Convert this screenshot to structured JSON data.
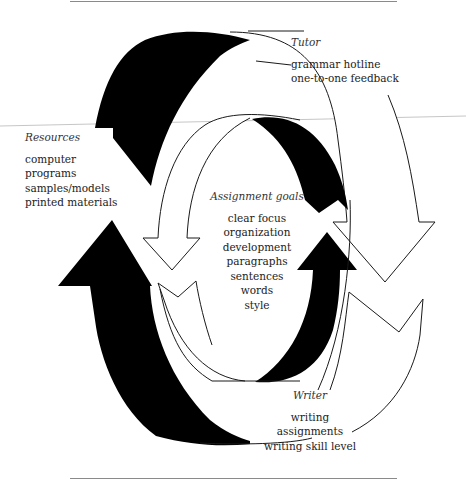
{
  "diagram": {
    "type": "cycle-of-arrows",
    "colors": {
      "solid_arrow": "#000000",
      "outline_arrow_stroke": "#1a1a1a",
      "outline_arrow_fill": "#ffffff",
      "rule": "#8a8a8a",
      "text": "#222222"
    },
    "nodes": {
      "tutor": {
        "title": "Tutor",
        "items": [
          "grammar hotline",
          "one-to-one feedback"
        ]
      },
      "resources": {
        "title": "Resources",
        "items": [
          "computer",
          "programs",
          "samples/models",
          "printed materials"
        ]
      },
      "assignment_goals": {
        "title": "Assignment goals",
        "items": [
          "clear focus",
          "organization",
          "development",
          "paragraphs",
          "sentences",
          "words",
          "style"
        ]
      },
      "writer": {
        "title": "Writer",
        "items": [
          "writing",
          "assignments",
          "writing skill level"
        ]
      }
    },
    "arrows": [
      {
        "name": "outer-black-arrow-top",
        "style": "solid",
        "direction": "counter-clockwise"
      },
      {
        "name": "outer-black-arrow-left",
        "style": "solid",
        "direction": "upward"
      },
      {
        "name": "outer-white-arrow-right",
        "style": "outline",
        "direction": "downward"
      },
      {
        "name": "outer-white-arrow-bottom",
        "style": "outline",
        "direction": "counter-clockwise"
      },
      {
        "name": "inner-black-arrow-right",
        "style": "solid",
        "direction": "upward"
      },
      {
        "name": "inner-black-arrow-top",
        "style": "solid",
        "direction": "downward"
      },
      {
        "name": "inner-white-arrow-left",
        "style": "outline",
        "direction": "downward"
      },
      {
        "name": "inner-white-arrow-bottom",
        "style": "outline",
        "direction": "upward"
      }
    ]
  }
}
